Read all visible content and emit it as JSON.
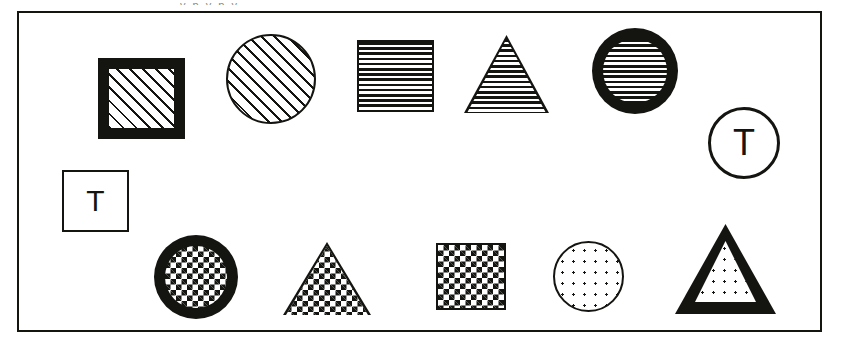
{
  "figure": {
    "caption_remnant": "y  p     y      p    y",
    "frame": {
      "x": 17,
      "y": 11,
      "width": 805,
      "height": 321,
      "border_color": "#15150f",
      "border_width": 2,
      "background": "#ffffff"
    },
    "ink_color": "#141410",
    "paper_color": "#ffffff"
  },
  "legend": {
    "shape_kinds": [
      "square",
      "circle",
      "triangle"
    ],
    "fill_patterns": [
      "diagonal-hatch",
      "horizontal-lines",
      "checkerboard",
      "dots",
      "blank"
    ],
    "border_weights": [
      "thick",
      "thin",
      "medium"
    ],
    "labels_present": [
      "T"
    ]
  },
  "shapes": [
    {
      "id": "shape-1",
      "name": "square-thick-border-diagonal-hatch",
      "kind": "square",
      "fill": "diagonal-hatch",
      "border": "thick",
      "label": "",
      "row": 1,
      "x": 96,
      "y": 56,
      "width": 87,
      "height": 81
    },
    {
      "id": "shape-2",
      "name": "circle-thin-border-diagonal-hatch",
      "kind": "circle",
      "fill": "diagonal-hatch",
      "border": "thin",
      "label": "",
      "row": 1,
      "x": 224,
      "y": 32,
      "width": 90,
      "height": 90
    },
    {
      "id": "shape-3",
      "name": "square-thin-border-horizontal-lines",
      "kind": "square",
      "fill": "horizontal-lines",
      "border": "thin",
      "label": "",
      "row": 1,
      "x": 355,
      "y": 38,
      "width": 77,
      "height": 72
    },
    {
      "id": "shape-4",
      "name": "triangle-horizontal-lines",
      "kind": "triangle",
      "fill": "horizontal-lines",
      "border": "thin",
      "label": "",
      "row": 1,
      "x": 462,
      "y": 33,
      "width": 85,
      "height": 78
    },
    {
      "id": "shape-5",
      "name": "circle-thick-border-horizontal-lines",
      "kind": "circle",
      "fill": "horizontal-lines",
      "border": "thick",
      "label": "",
      "row": 1,
      "x": 590,
      "y": 26,
      "width": 86,
      "height": 86
    },
    {
      "id": "shape-6",
      "name": "circle-blank-letter-t",
      "kind": "circle",
      "fill": "blank",
      "border": "medium",
      "label": "T",
      "row": 1,
      "x": 706,
      "y": 105,
      "width": 72,
      "height": 72
    },
    {
      "id": "shape-7",
      "name": "square-blank-letter-t",
      "kind": "square",
      "fill": "blank",
      "border": "thin",
      "label": "T",
      "row": 2,
      "x": 60,
      "y": 168,
      "width": 67,
      "height": 62
    },
    {
      "id": "shape-8",
      "name": "circle-thick-border-checkerboard",
      "kind": "circle",
      "fill": "checkerboard",
      "border": "thick",
      "label": "",
      "row": 2,
      "x": 152,
      "y": 233,
      "width": 84,
      "height": 84
    },
    {
      "id": "shape-9",
      "name": "triangle-checkerboard",
      "kind": "triangle",
      "fill": "checkerboard",
      "border": "thin",
      "label": "",
      "row": 2,
      "x": 281,
      "y": 240,
      "width": 88,
      "height": 73
    },
    {
      "id": "shape-10",
      "name": "square-thin-border-checkerboard",
      "kind": "square",
      "fill": "checkerboard",
      "border": "thin",
      "label": "",
      "row": 2,
      "x": 434,
      "y": 241,
      "width": 70,
      "height": 67
    },
    {
      "id": "shape-11",
      "name": "circle-thin-border-dots",
      "kind": "circle",
      "fill": "dots",
      "border": "thin",
      "label": "",
      "row": 2,
      "x": 551,
      "y": 239,
      "width": 71,
      "height": 71
    },
    {
      "id": "shape-12",
      "name": "triangle-thick-border-dots",
      "kind": "triangle",
      "fill": "dots",
      "border": "thick",
      "label": "",
      "row": 2,
      "x": 673,
      "y": 222,
      "width": 101,
      "height": 90
    }
  ]
}
